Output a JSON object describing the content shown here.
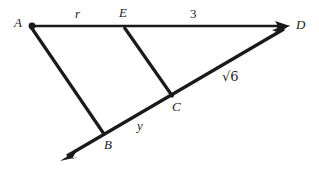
{
  "figure": {
    "type": "geometry-diagram",
    "background_color": "#ffffff",
    "stroke_color": "#1a1a1a",
    "width": 319,
    "height": 171
  },
  "points": [
    {
      "id": "A",
      "label": "A",
      "x": 31,
      "y": 26,
      "label_x": 14,
      "label_y": 16,
      "has_dot": true
    },
    {
      "id": "E",
      "label": "E",
      "x": 124,
      "y": 26,
      "label_x": 119,
      "label_y": 6,
      "has_dot": false
    },
    {
      "id": "D",
      "label": "D",
      "x": 288,
      "y": 26,
      "label_x": 296,
      "label_y": 18,
      "has_dot": false
    },
    {
      "id": "C",
      "label": "C",
      "x": 172,
      "y": 95,
      "label_x": 172,
      "label_y": 100,
      "has_dot": false
    },
    {
      "id": "B",
      "label": "B",
      "x": 103,
      "y": 133,
      "label_x": 104,
      "label_y": 138,
      "has_dot": false
    }
  ],
  "segment_labels": [
    {
      "id": "r",
      "text": "r",
      "x": 75,
      "y": 7,
      "italic": true,
      "radical": false
    },
    {
      "id": "three",
      "text": "3",
      "x": 190,
      "y": 7,
      "italic": false,
      "radical": false
    },
    {
      "id": "root6",
      "text": "√6",
      "x": 222,
      "y": 70,
      "italic": false,
      "radical": true
    },
    {
      "id": "y",
      "text": "y",
      "x": 137,
      "y": 119,
      "italic": true,
      "radical": false
    }
  ],
  "lines": [
    {
      "id": "line-A-D",
      "from": "A",
      "to": "D",
      "arrow_end": true,
      "arrow_start": false
    },
    {
      "id": "line-A-B",
      "from": "A",
      "to": "B",
      "arrow_end": false,
      "arrow_start": false
    },
    {
      "id": "line-E-C",
      "from": "E",
      "to": "C",
      "arrow_end": false,
      "arrow_start": false
    },
    {
      "id": "ray-B-D",
      "from": "B",
      "to": "D",
      "arrow_end": true,
      "arrow_start": true
    }
  ]
}
